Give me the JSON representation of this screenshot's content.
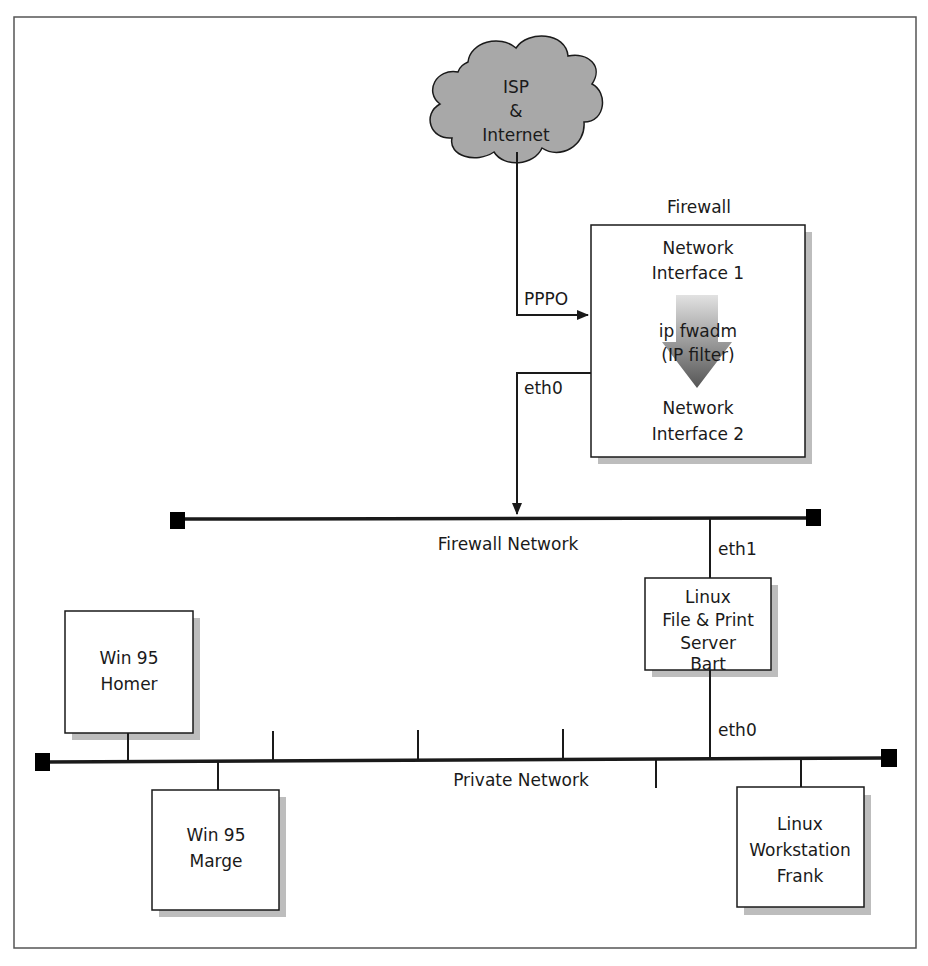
{
  "cloud": {
    "lines": [
      "ISP",
      "&",
      "Internet"
    ],
    "fill": "#a8a8a8"
  },
  "firewall": {
    "title": "Firewall",
    "interface1": [
      "Network",
      "Interface 1"
    ],
    "filter": [
      "ip fwadm",
      "(IP filter)"
    ],
    "interface2": [
      "Network",
      "Interface 2"
    ]
  },
  "links": {
    "pppo": "PPPO",
    "fw_eth0": "eth0",
    "bart_eth1": "eth1",
    "bart_eth0": "eth0"
  },
  "networks": {
    "firewall_network": "Firewall Network",
    "private_network": "Private Network"
  },
  "hosts": {
    "bart": [
      "Linux",
      "File & Print",
      "Server",
      "Bart"
    ],
    "homer": [
      "Win 95",
      "Homer"
    ],
    "marge": [
      "Win 95",
      "Marge"
    ],
    "frank": [
      "Linux",
      "Workstation",
      "Frank"
    ]
  },
  "colors": {
    "shadow": "#bdbdbd",
    "arrow_dark": "#5a5a5a",
    "arrow_light": "#d0d0d0"
  }
}
